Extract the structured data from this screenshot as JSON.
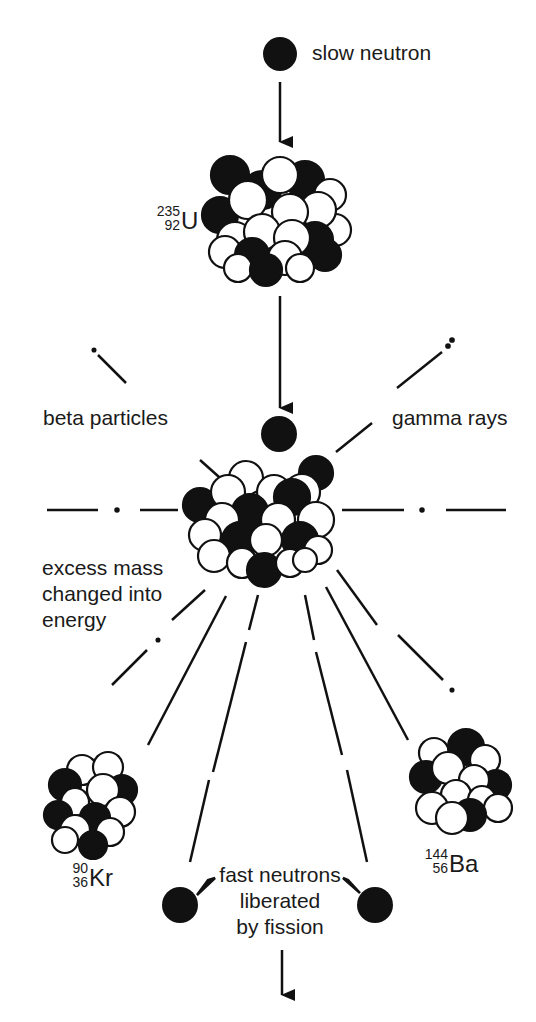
{
  "diagram": {
    "type": "nuclear fission of uranium-235",
    "labels": {
      "slow_neutron": "slow neutron",
      "beta_particles": "beta particles",
      "gamma_rays": "gamma rays",
      "excess_mass": [
        "excess mass",
        "changed into",
        "energy"
      ],
      "fast_neutrons": [
        "fast neutrons",
        "liberated",
        "by fission"
      ]
    },
    "isotopes": {
      "uranium": {
        "mass": "235",
        "atomic": "92",
        "symbol": "U"
      },
      "krypton": {
        "mass": "90",
        "atomic": "36",
        "symbol": "Kr"
      },
      "barium": {
        "mass": "144",
        "atomic": "56",
        "symbol": "Ba"
      }
    },
    "colors": {
      "ink": "#111111",
      "background": "#ffffff"
    }
  }
}
